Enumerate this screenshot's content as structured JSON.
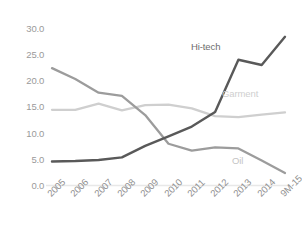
{
  "chart_data": {
    "type": "line",
    "title": "",
    "subtitle": "",
    "xlabel": "",
    "ylabel": "",
    "categories": [
      "2005",
      "2006",
      "2007",
      "2008",
      "2009",
      "2010",
      "2011",
      "2012",
      "2013",
      "2014",
      "9M-15"
    ],
    "ylim": [
      0.0,
      30.0
    ],
    "yticks": [
      0.0,
      5.0,
      10.0,
      15.0,
      20.0,
      25.0,
      30.0
    ],
    "ytick_labels": [
      "0.0",
      "5.0",
      "10.0",
      "15.0",
      "20.0",
      "25.0",
      "30.0"
    ],
    "grid": false,
    "legend": "inline-labels",
    "series": [
      {
        "name": "Hi-tech",
        "color": "#595959",
        "values": [
          4.6,
          4.7,
          4.9,
          5.4,
          7.6,
          9.4,
          11.3,
          14.1,
          24.1,
          23.1,
          28.5
        ]
      },
      {
        "name": "Oil",
        "color": "#9c9c9c",
        "values": [
          22.5,
          20.4,
          17.8,
          17.2,
          13.5,
          8.0,
          6.7,
          7.3,
          7.1,
          4.8,
          2.4
        ]
      },
      {
        "name": "Garment",
        "color": "#cfcfcf",
        "values": [
          14.5,
          14.5,
          15.7,
          14.4,
          15.4,
          15.5,
          14.8,
          13.3,
          13.1,
          13.6,
          14.0
        ]
      }
    ],
    "annotations": [
      {
        "text": "Hi-tech",
        "series": "Hi-tech",
        "color": "#6d6d6d"
      },
      {
        "text": "Garment",
        "series": "Garment",
        "color": "#cfcfcf"
      },
      {
        "text": "Oil",
        "series": "Oil",
        "color": "#c4c4c4"
      }
    ],
    "axis_color": "#e8e8e8"
  }
}
